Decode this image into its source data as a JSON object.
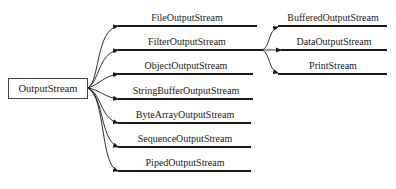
{
  "diagram": {
    "root": {
      "label": "OutputStream"
    },
    "children": [
      {
        "label": "FileOutputStream",
        "y": 26
      },
      {
        "label": "FilterOutputStream",
        "y": 50
      },
      {
        "label": "ObjectOutputStream",
        "y": 74
      },
      {
        "label": "StringBufferOutputStream",
        "y": 99
      },
      {
        "label": "ByteArrayOutputStream",
        "y": 123
      },
      {
        "label": "SequenceOutputStream",
        "y": 147
      },
      {
        "label": "PipedOutputStream",
        "y": 171
      }
    ],
    "filter_children": [
      {
        "label": "BufferedOutputStream",
        "y": 26
      },
      {
        "label": "DataOutputStream",
        "y": 50
      },
      {
        "label": "PrintStream",
        "y": 74
      }
    ],
    "colors": {
      "line": "#1a1a1a",
      "text": "#222222",
      "box_border": "#444444"
    }
  }
}
